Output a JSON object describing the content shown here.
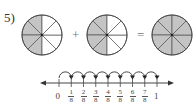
{
  "problem_number": "5)",
  "operators": {
    "plus": "+",
    "equals": "="
  },
  "circles": [
    {
      "slices": 8,
      "shaded": 4,
      "cx": 42,
      "cy": 35
    },
    {
      "slices": 8,
      "shaded": 4,
      "cx": 107,
      "cy": 35
    },
    {
      "slices": 8,
      "shaded": 8,
      "cx": 172,
      "cy": 35
    }
  ],
  "colors": {
    "shade": "#c4c4c4",
    "stroke": "#555555"
  },
  "number_line": {
    "start_label": "0",
    "end_label": "1",
    "fractions": [
      {
        "num": "1",
        "den": "8"
      },
      {
        "num": "2",
        "den": "8"
      },
      {
        "num": "3",
        "den": "8"
      },
      {
        "num": "4",
        "den": "8"
      },
      {
        "num": "5",
        "den": "8"
      },
      {
        "num": "6",
        "den": "8"
      },
      {
        "num": "7",
        "den": "8"
      }
    ],
    "hops": 8
  }
}
